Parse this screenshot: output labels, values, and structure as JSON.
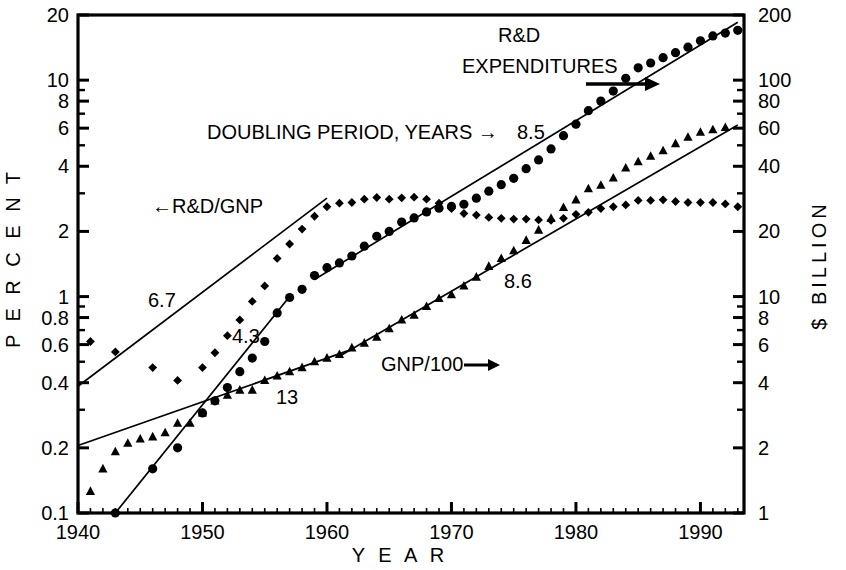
{
  "chart_data": {
    "type": "scatter",
    "title": "",
    "xlabel": "Y E A R",
    "ylabel": "P E R C E N T",
    "y2label": "$ BILLION",
    "xlim": [
      1940,
      1993.5
    ],
    "ylim": [
      0.1,
      20
    ],
    "y2lim": [
      1,
      200
    ],
    "yscale": "log",
    "y2scale": "log",
    "grid": false,
    "legend_position": "inline-annotations",
    "x_ticks": [
      1940,
      1950,
      1960,
      1970,
      1980,
      1990
    ],
    "x_tick_labels": [
      "1940",
      "1950",
      "1960",
      "1970",
      "1980",
      "1990"
    ],
    "y_ticks": [
      0.1,
      0.2,
      0.4,
      0.6,
      0.8,
      1,
      2,
      4,
      6,
      8,
      10,
      20
    ],
    "y_tick_labels": [
      "0.1",
      "0.2",
      "0.4",
      "0.6",
      "0.8",
      "1",
      "2",
      "4",
      "6",
      "8",
      "10",
      "20"
    ],
    "y2_ticks": [
      1,
      2,
      4,
      6,
      8,
      10,
      20,
      40,
      60,
      80,
      100,
      200
    ],
    "y2_tick_labels": [
      "1",
      "2",
      "4",
      "6",
      "8",
      "10",
      "20",
      "40",
      "60",
      "80",
      "100",
      "200"
    ],
    "series": [
      {
        "name": "R&D/GNP",
        "marker": "diamond",
        "axis": "left",
        "unit": "percent",
        "points": [
          [
            1941,
            0.62
          ],
          [
            1943,
            0.555
          ],
          [
            1946,
            0.47
          ],
          [
            1948,
            0.41
          ],
          [
            1950,
            0.47
          ],
          [
            1951,
            0.55
          ],
          [
            1952,
            0.66
          ],
          [
            1953,
            0.78
          ],
          [
            1954,
            0.95
          ],
          [
            1955,
            1.12
          ],
          [
            1956,
            1.5
          ],
          [
            1957,
            1.75
          ],
          [
            1958,
            2.05
          ],
          [
            1959,
            2.35
          ],
          [
            1960,
            2.6
          ],
          [
            1961,
            2.7
          ],
          [
            1962,
            2.72
          ],
          [
            1963,
            2.82
          ],
          [
            1964,
            2.87
          ],
          [
            1965,
            2.82
          ],
          [
            1966,
            2.86
          ],
          [
            1967,
            2.88
          ],
          [
            1968,
            2.82
          ],
          [
            1969,
            2.7
          ],
          [
            1970,
            2.55
          ],
          [
            1971,
            2.42
          ],
          [
            1972,
            2.38
          ],
          [
            1973,
            2.32
          ],
          [
            1974,
            2.3
          ],
          [
            1975,
            2.28
          ],
          [
            1976,
            2.28
          ],
          [
            1977,
            2.26
          ],
          [
            1978,
            2.25
          ],
          [
            1979,
            2.3
          ],
          [
            1980,
            2.4
          ],
          [
            1981,
            2.45
          ],
          [
            1982,
            2.55
          ],
          [
            1983,
            2.6
          ],
          [
            1984,
            2.65
          ],
          [
            1985,
            2.78
          ],
          [
            1986,
            2.78
          ],
          [
            1987,
            2.8
          ],
          [
            1988,
            2.75
          ],
          [
            1989,
            2.72
          ],
          [
            1990,
            2.72
          ],
          [
            1991,
            2.72
          ],
          [
            1992,
            2.68
          ],
          [
            1993,
            2.6
          ]
        ],
        "fit_line": {
          "x0": 1940,
          "y0": 0.385,
          "x1": 1960,
          "y1": 2.85
        },
        "doubling_period": "6.7",
        "label": "←R&D/GNP"
      },
      {
        "name": "R&D EXPENDITURES",
        "marker": "circle",
        "axis": "right",
        "unit": "billion-dollars",
        "points": [
          [
            1943,
            1.0
          ],
          [
            1946,
            1.6
          ],
          [
            1948,
            2.0
          ],
          [
            1950,
            2.9
          ],
          [
            1951,
            3.3
          ],
          [
            1952,
            3.8
          ],
          [
            1953,
            4.5
          ],
          [
            1954,
            5.2
          ],
          [
            1955,
            6.2
          ],
          [
            1956,
            8.4
          ],
          [
            1957,
            9.9
          ],
          [
            1958,
            10.8
          ],
          [
            1959,
            12.5
          ],
          [
            1960,
            13.6
          ],
          [
            1961,
            14.3
          ],
          [
            1962,
            15.4
          ],
          [
            1963,
            17.1
          ],
          [
            1964,
            19.0
          ],
          [
            1965,
            20.0
          ],
          [
            1966,
            22.1
          ],
          [
            1967,
            23.1
          ],
          [
            1968,
            24.6
          ],
          [
            1969,
            25.6
          ],
          [
            1970,
            26.1
          ],
          [
            1971,
            26.7
          ],
          [
            1972,
            28.5
          ],
          [
            1973,
            30.7
          ],
          [
            1974,
            32.9
          ],
          [
            1975,
            35.2
          ],
          [
            1976,
            39.0
          ],
          [
            1977,
            42.8
          ],
          [
            1978,
            48.1
          ],
          [
            1979,
            55.4
          ],
          [
            1980,
            62.6
          ],
          [
            1981,
            72.3
          ],
          [
            1982,
            80.0
          ],
          [
            1983,
            89.0
          ],
          [
            1984,
            102.0
          ],
          [
            1985,
            114.0
          ],
          [
            1986,
            120.0
          ],
          [
            1987,
            127.0
          ],
          [
            1988,
            134.0
          ],
          [
            1989,
            142.0
          ],
          [
            1990,
            152.0
          ],
          [
            1991,
            160.0
          ],
          [
            1992,
            165.0
          ],
          [
            1993,
            170.0
          ]
        ],
        "fit_line": {
          "x0": 1943,
          "y0": 1.0,
          "x1": 1957,
          "y1": 10.0
        },
        "fit_line2": {
          "x0": 1959,
          "y0": 12.0,
          "x1": 1993,
          "y1": 185.0
        },
        "doubling_period": "4.3",
        "doubling_period_late": "8.5",
        "label": "R&D EXPENDITURES →"
      },
      {
        "name": "GNP/100",
        "marker": "triangle",
        "axis": "right",
        "unit": "billion-dollars",
        "points": [
          [
            1941,
            1.26
          ],
          [
            1942,
            1.6
          ],
          [
            1943,
            1.92
          ],
          [
            1944,
            2.1
          ],
          [
            1945,
            2.2
          ],
          [
            1946,
            2.25
          ],
          [
            1947,
            2.35
          ],
          [
            1948,
            2.6
          ],
          [
            1949,
            2.6
          ],
          [
            1950,
            2.9
          ],
          [
            1951,
            3.3
          ],
          [
            1952,
            3.5
          ],
          [
            1953,
            3.7
          ],
          [
            1954,
            3.7
          ],
          [
            1955,
            4.1
          ],
          [
            1956,
            4.3
          ],
          [
            1957,
            4.5
          ],
          [
            1958,
            4.7
          ],
          [
            1959,
            5.0
          ],
          [
            1960,
            5.2
          ],
          [
            1961,
            5.4
          ],
          [
            1962,
            5.8
          ],
          [
            1963,
            6.1
          ],
          [
            1964,
            6.5
          ],
          [
            1965,
            7.1
          ],
          [
            1966,
            7.8
          ],
          [
            1967,
            8.2
          ],
          [
            1968,
            9.0
          ],
          [
            1969,
            9.8
          ],
          [
            1970,
            10.2
          ],
          [
            1971,
            11.2
          ],
          [
            1972,
            12.3
          ],
          [
            1973,
            13.8
          ],
          [
            1974,
            15.0
          ],
          [
            1975,
            16.3
          ],
          [
            1976,
            18.2
          ],
          [
            1977,
            20.3
          ],
          [
            1978,
            23.0
          ],
          [
            1979,
            25.8
          ],
          [
            1980,
            28.0
          ],
          [
            1981,
            31.5
          ],
          [
            1982,
            32.7
          ],
          [
            1983,
            35.3
          ],
          [
            1984,
            39.3
          ],
          [
            1985,
            42.0
          ],
          [
            1986,
            44.5
          ],
          [
            1987,
            47.2
          ],
          [
            1988,
            50.9
          ],
          [
            1989,
            54.5
          ],
          [
            1990,
            57.5
          ],
          [
            1991,
            59.0
          ],
          [
            1992,
            60.5
          ]
        ],
        "fit_line": {
          "x0": 1940,
          "y0": 2.05,
          "x1": 1962,
          "y1": 5.7
        },
        "fit_line2": {
          "x0": 1961,
          "y0": 5.3,
          "x1": 1993,
          "y1": 62.0
        },
        "doubling_period": "13",
        "doubling_period_late": "8.6",
        "label": "GNP/100→"
      }
    ],
    "annotations": [
      {
        "id": "doubling-period",
        "text": "DOUBLING PERIOD, YEARS →",
        "x": 207,
        "y": 139
      },
      {
        "id": "doubling-8-5",
        "text": "8.5",
        "x": 517,
        "y": 139
      },
      {
        "id": "rd-gnp-label",
        "text": "←R&D/GNP",
        "x": 152,
        "y": 213
      },
      {
        "id": "rd-exp-label-1",
        "text": "R&D",
        "x": 498,
        "y": 42
      },
      {
        "id": "rd-exp-label-2",
        "text": "EXPENDITURES",
        "x": 462,
        "y": 73
      },
      {
        "id": "gnp-label",
        "text": "GNP/100",
        "x": 381,
        "y": 371
      },
      {
        "id": "doubling-6-7",
        "text": "6.7",
        "x": 148,
        "y": 307
      },
      {
        "id": "doubling-4-3",
        "text": "4.3",
        "x": 232,
        "y": 343
      },
      {
        "id": "doubling-13",
        "text": "13",
        "x": 276,
        "y": 404
      },
      {
        "id": "doubling-8-6",
        "text": "8.6",
        "x": 504,
        "y": 288
      }
    ]
  },
  "axes": {
    "left_title": "P E R C E N T",
    "right_title": "$ BILLION",
    "bottom_title": "Y E A R"
  },
  "colors": {
    "foreground": "#000000",
    "background": "#ffffff"
  }
}
